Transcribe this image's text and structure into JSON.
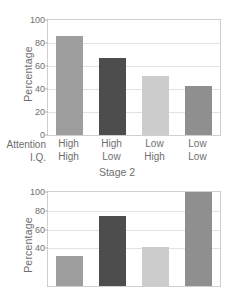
{
  "chart_data": [
    {
      "id": "stage2-top",
      "type": "bar",
      "title": "",
      "xlabel": "Stage 2",
      "ylabel": "Percentage",
      "ylim": [
        0,
        100
      ],
      "yticks": [
        0,
        20,
        40,
        60,
        80,
        100
      ],
      "ytick_labels": [
        "0",
        "20",
        "40",
        "60",
        "80",
        "100"
      ],
      "grid": true,
      "legend": "none",
      "row_labels": [
        "Attention",
        "I.Q."
      ],
      "categories": [
        {
          "attention": "High",
          "iq": "High"
        },
        {
          "attention": "High",
          "iq": "Low"
        },
        {
          "attention": "Low",
          "iq": "High"
        },
        {
          "attention": "Low",
          "iq": "Low"
        }
      ],
      "values": [
        86,
        67,
        51,
        43
      ],
      "colors": [
        "#9e9e9e",
        "#4d4d4d",
        "#cccccc",
        "#8f8f8f"
      ]
    },
    {
      "id": "stage-bottom",
      "type": "bar",
      "title": "",
      "xlabel": "",
      "ylabel": "Percentage",
      "ylim": [
        0,
        100
      ],
      "yticks": [
        40,
        60,
        80,
        100
      ],
      "ytick_labels": [
        "40",
        "60",
        "80",
        "100"
      ],
      "grid": true,
      "legend": "none",
      "categories": [
        {
          "attention": "High",
          "iq": "High"
        },
        {
          "attention": "High",
          "iq": "Low"
        },
        {
          "attention": "Low",
          "iq": "High"
        },
        {
          "attention": "Low",
          "iq": "Low"
        }
      ],
      "values": [
        32,
        74,
        41,
        100
      ],
      "colors": [
        "#9e9e9e",
        "#4d4d4d",
        "#cccccc",
        "#8f8f8f"
      ]
    }
  ]
}
